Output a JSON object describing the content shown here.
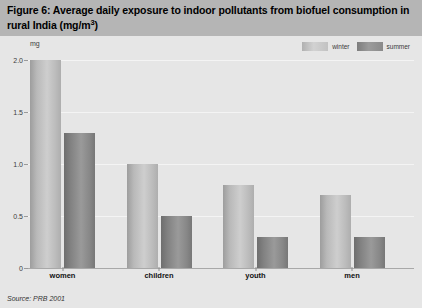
{
  "figure": {
    "title": "Figure 6: Average daily exposure to indoor pollutants from biofuel consumption in rural India (mg/m",
    "title_superscript": "3",
    "title_suffix": ")",
    "source": "Source: PRB 2001",
    "axis_unit": "mg",
    "banner_color": "#b5b5b5",
    "background_color": "#e6e6e6",
    "winter_color": "#c6c6c6",
    "summer_color": "#8c8c8c"
  },
  "chart_data": {
    "type": "bar",
    "title": "Figure 6: Average daily exposure to indoor pollutants from biofuel consumption in rural India (mg/m3)",
    "xlabel": "",
    "ylabel": "mg",
    "ylim": [
      0,
      2.0
    ],
    "yticks": [
      0,
      0.5,
      1.0,
      1.5,
      2.0
    ],
    "ytick_labels": [
      "0",
      "0.5",
      "1.0",
      "1.5",
      "2.0"
    ],
    "grid": true,
    "legend_position": "top-right",
    "categories": [
      "women",
      "children",
      "youth",
      "men"
    ],
    "series": [
      {
        "name": "winter",
        "values": [
          2.0,
          1.0,
          0.8,
          0.7
        ]
      },
      {
        "name": "summer",
        "values": [
          1.3,
          0.5,
          0.3,
          0.3
        ]
      }
    ]
  }
}
